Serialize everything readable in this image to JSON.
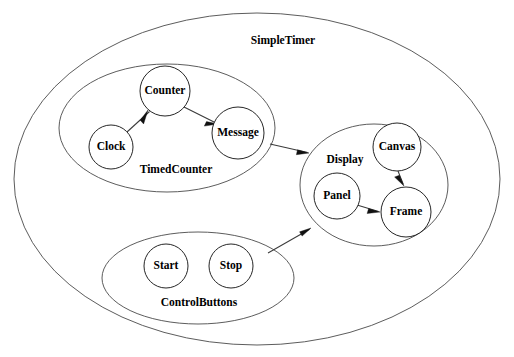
{
  "diagram": {
    "title": "SimpleTimer",
    "title_position": {
      "x": 283,
      "y": 41
    },
    "type": "nested-cluster-graph",
    "background_color": "#ffffff",
    "node_stroke_color": "#1a1a1a",
    "cluster_stroke_color": "#4a4a4a",
    "edge_color": "#3a3a3a",
    "label_color": "#000000",
    "outer_cluster": {
      "name": "SimpleTimer",
      "label": "SimpleTimer",
      "shape": "ellipse",
      "cx": 257,
      "cy": 179,
      "rx": 243,
      "ry": 166
    },
    "clusters": [
      {
        "id": "timedcounter",
        "label": "TimedCounter",
        "shape": "ellipse",
        "cx": 167,
        "cy": 128,
        "rx": 108,
        "ry": 64,
        "label_x": 176,
        "label_y": 170
      },
      {
        "id": "display",
        "label": "Display",
        "shape": "ellipse",
        "cx": 374,
        "cy": 185,
        "rx": 74,
        "ry": 61,
        "label_x": 345,
        "label_y": 160
      },
      {
        "id": "controlbuttons",
        "label": "ControlButtons",
        "shape": "ellipse",
        "cx": 198,
        "cy": 278,
        "rx": 96,
        "ry": 46,
        "label_x": 199,
        "label_y": 303
      }
    ],
    "nodes": [
      {
        "id": "counter",
        "label": "Counter",
        "cluster": "timedcounter",
        "cx": 165,
        "cy": 91,
        "r": 25
      },
      {
        "id": "clock",
        "label": "Clock",
        "cluster": "timedcounter",
        "cx": 111,
        "cy": 147,
        "r": 22
      },
      {
        "id": "message",
        "label": "Message",
        "cluster": "timedcounter",
        "cx": 238,
        "cy": 133,
        "r": 26
      },
      {
        "id": "canvas",
        "label": "Canvas",
        "cluster": "display",
        "cx": 397,
        "cy": 147,
        "r": 24
      },
      {
        "id": "panel",
        "label": "Panel",
        "cluster": "display",
        "cx": 337,
        "cy": 196,
        "r": 23
      },
      {
        "id": "frame",
        "label": "Frame",
        "cluster": "display",
        "cx": 406,
        "cy": 212,
        "r": 25
      }
    ],
    "edges": [
      {
        "id": "clock-to-counter",
        "from": "clock",
        "to": "counter",
        "x1": 127,
        "y1": 132,
        "x2": 148,
        "y2": 110,
        "directed": true
      },
      {
        "id": "counter-to-message",
        "from": "counter",
        "to": "message",
        "x1": 184,
        "y1": 107,
        "x2": 218,
        "y2": 124,
        "directed": true
      },
      {
        "id": "timedcounter-to-display",
        "from": "TimedCounter",
        "to": "Display",
        "x1": 270,
        "y1": 144,
        "x2": 309,
        "y2": 153,
        "directed": true
      },
      {
        "id": "controlbuttons-to-display",
        "from": "ControlButtons",
        "to": "Display",
        "x1": 268,
        "y1": 253,
        "x2": 311,
        "y2": 228,
        "directed": true
      },
      {
        "id": "canvas-to-frame",
        "from": "canvas",
        "to": "frame",
        "x1": 399,
        "y1": 172,
        "x2": 404,
        "y2": 186,
        "directed": true
      },
      {
        "id": "panel-to-frame",
        "from": "panel",
        "to": "frame",
        "x1": 357,
        "y1": 205,
        "x2": 380,
        "y2": 212,
        "directed": true
      }
    ],
    "node_labels": {
      "counter": "Counter",
      "clock": "Clock",
      "message": "Message",
      "canvas": "Canvas",
      "panel": "Panel",
      "frame": "Frame",
      "start": "Start",
      "stop": "Stop"
    },
    "control_nodes": [
      {
        "id": "start",
        "label": "Start",
        "cluster": "controlbuttons",
        "cx": 166,
        "cy": 266,
        "r": 22
      },
      {
        "id": "stop",
        "label": "Stop",
        "cluster": "controlbuttons",
        "cx": 231,
        "cy": 266,
        "r": 22
      }
    ]
  }
}
